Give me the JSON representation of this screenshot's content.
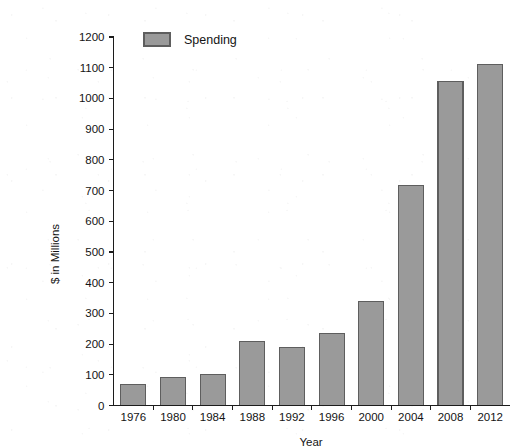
{
  "chart_data": {
    "type": "bar",
    "title": "",
    "subtitle": "",
    "xlabel": "Year",
    "ylabel": "$ in Millions",
    "categories": [
      "1976",
      "1980",
      "1984",
      "1988",
      "1992",
      "1996",
      "2000",
      "2004",
      "2008",
      "2012"
    ],
    "values": [
      68,
      92,
      102,
      207,
      190,
      235,
      340,
      715,
      1055,
      1110
    ],
    "series": [
      {
        "name": "Spending",
        "values": [
          68,
          92,
          102,
          207,
          190,
          235,
          340,
          715,
          1055,
          1110
        ]
      }
    ],
    "ylim": [
      0,
      1200
    ],
    "ytick_values": [
      0,
      100,
      200,
      300,
      400,
      500,
      600,
      700,
      800,
      900,
      1000,
      1100,
      1200
    ],
    "ytick_labels": [
      "0",
      "100",
      "200",
      "300",
      "400",
      "500",
      "600",
      "700",
      "800",
      "900",
      "1000",
      "1100",
      "1200"
    ],
    "grid": false,
    "legend": {
      "entries": [
        "Spending"
      ],
      "position": "top-left-inside"
    },
    "colors": {
      "bar_fill": "#9a9a9a",
      "bar_border": "#5e5e5e",
      "axis": "#1c1c1c",
      "text": "#141414",
      "background": "#ffffff"
    }
  },
  "axes": {
    "y_axis_title": "$ in Millions",
    "x_axis_title": "Year"
  },
  "legend": {
    "series_label": "Spending"
  }
}
